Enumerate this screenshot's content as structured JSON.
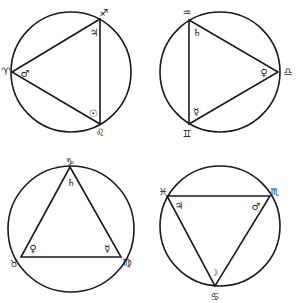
{
  "figure": {
    "colors": {
      "ink": "#1a1a1a",
      "background": "#ffffff"
    },
    "diagrams": [
      {
        "id": "fire",
        "circle": {
          "cx": 71,
          "cy": 72,
          "r": 60
        },
        "vertices": [
          {
            "sign": "♈",
            "sign_name": "Aries",
            "x": 12,
            "y": 72,
            "label_x": 6,
            "label_y": 71,
            "planet": "♂",
            "planet_name": "Mars",
            "planet_x": 25,
            "planet_y": 73
          },
          {
            "sign": "♐",
            "sign_name": "Sagittarius",
            "x": 100,
            "y": 19,
            "label_x": 104,
            "label_y": 12,
            "planet": "♃",
            "planet_name": "Jupiter",
            "planet_x": 94,
            "planet_y": 32
          },
          {
            "sign": "♌",
            "sign_name": "Leo",
            "x": 100,
            "y": 124,
            "label_x": 100,
            "label_y": 132,
            "planet": "☉",
            "planet_name": "Sun",
            "planet_x": 93,
            "planet_y": 113
          }
        ]
      },
      {
        "id": "air",
        "circle": {
          "cx": 220,
          "cy": 72,
          "r": 60
        },
        "vertices": [
          {
            "sign": "♒",
            "sign_name": "Aquarius",
            "x": 189,
            "y": 20,
            "label_x": 187,
            "label_y": 12,
            "planet": "♄",
            "planet_name": "Saturn",
            "planet_x": 197,
            "planet_y": 32
          },
          {
            "sign": "♎",
            "sign_name": "Libra",
            "x": 278,
            "y": 72,
            "label_x": 288,
            "label_y": 71,
            "planet": "♀",
            "planet_name": "Venus",
            "planet_x": 264,
            "planet_y": 72
          },
          {
            "sign": "♊",
            "sign_name": "Gemini",
            "x": 189,
            "y": 124,
            "label_x": 187,
            "label_y": 133,
            "planet": "☿",
            "planet_name": "Mercury",
            "planet_x": 196,
            "planet_y": 111
          }
        ]
      },
      {
        "id": "earth",
        "circle": {
          "cx": 71,
          "cy": 229,
          "r": 63
        },
        "vertices": [
          {
            "sign": "♑",
            "sign_name": "Capricorn",
            "x": 70,
            "y": 167,
            "label_x": 70,
            "label_y": 161,
            "planet": "♄",
            "planet_name": "Saturn",
            "planet_x": 71,
            "planet_y": 182
          },
          {
            "sign": "♉",
            "sign_name": "Taurus",
            "x": 21,
            "y": 257,
            "label_x": 14,
            "label_y": 263,
            "planet": "♀",
            "planet_name": "Venus",
            "planet_x": 33,
            "planet_y": 248
          },
          {
            "sign": "♍",
            "sign_name": "Virgo",
            "x": 121,
            "y": 257,
            "label_x": 127,
            "label_y": 262,
            "planet": "☿",
            "planet_name": "Mercury",
            "planet_x": 107,
            "planet_y": 248
          }
        ]
      },
      {
        "id": "water",
        "circle": {
          "cx": 220,
          "cy": 226,
          "r": 60
        },
        "vertices": [
          {
            "sign": "♓",
            "sign_name": "Pisces",
            "x": 167,
            "y": 196,
            "label_x": 163,
            "label_y": 191,
            "planet": "♃",
            "planet_name": "Jupiter",
            "planet_x": 179,
            "planet_y": 205
          },
          {
            "sign": "♏",
            "sign_name": "Scorpio",
            "x": 270,
            "y": 196,
            "label_x": 275,
            "label_y": 191,
            "planet": "♂",
            "planet_name": "Mars",
            "planet_x": 256,
            "planet_y": 206
          },
          {
            "sign": "♋",
            "sign_name": "Cancer",
            "x": 215,
            "y": 286,
            "label_x": 215,
            "label_y": 296,
            "planet": "☽",
            "planet_name": "Moon",
            "planet_x": 214,
            "planet_y": 272
          }
        ]
      }
    ]
  }
}
